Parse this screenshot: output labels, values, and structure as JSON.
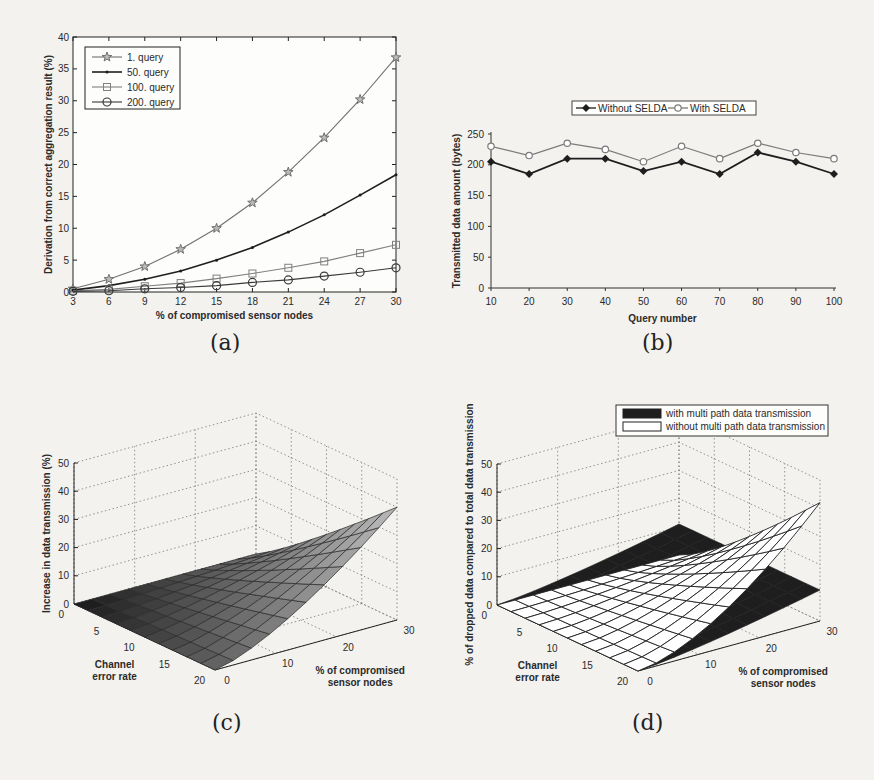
{
  "figure": {
    "captions": [
      "(a)",
      "(b)",
      "(c)",
      "(d)"
    ]
  },
  "chart_data": [
    {
      "id": "a",
      "type": "line",
      "title": "",
      "xlabel": "% of compromised sensor nodes",
      "ylabel": "Derivation from correct aggregation result (%)",
      "x": [
        3,
        6,
        9,
        12,
        15,
        18,
        21,
        24,
        27,
        30
      ],
      "xlim": [
        3,
        30
      ],
      "ylim": [
        0,
        40
      ],
      "yticks": [
        0,
        5,
        10,
        15,
        20,
        25,
        30,
        35,
        40
      ],
      "grid": false,
      "legend_position": "upper-left",
      "series": [
        {
          "name": "1. query",
          "marker": "star",
          "color": "#707070",
          "values": [
            0.5,
            2.0,
            4.0,
            6.7,
            10.0,
            14.0,
            18.8,
            24.2,
            30.2,
            36.8
          ]
        },
        {
          "name": "50. query",
          "marker": "dot",
          "color": "#1e1e1e",
          "values": [
            0.3,
            1.0,
            2.0,
            3.3,
            5.0,
            7.0,
            9.4,
            12.1,
            15.2,
            18.4
          ]
        },
        {
          "name": "100. query",
          "marker": "square",
          "color": "#808080",
          "values": [
            0.2,
            0.4,
            0.9,
            1.4,
            2.1,
            2.9,
            3.8,
            4.8,
            6.1,
            7.4
          ]
        },
        {
          "name": "200. query",
          "marker": "circle",
          "color": "#3a3a3a",
          "values": [
            0.1,
            0.2,
            0.5,
            0.7,
            1.0,
            1.5,
            1.9,
            2.5,
            3.1,
            3.8
          ]
        }
      ]
    },
    {
      "id": "b",
      "type": "line",
      "title": "",
      "xlabel": "Query number",
      "ylabel": "Transmitted data amount (bytes)",
      "x": [
        10,
        20,
        30,
        40,
        50,
        60,
        70,
        80,
        90,
        100
      ],
      "xlim": [
        10,
        100
      ],
      "ylim": [
        0,
        250
      ],
      "yticks": [
        0,
        50,
        100,
        150,
        200,
        250
      ],
      "grid": false,
      "legend_position": "top-center-outside",
      "series": [
        {
          "name": "Without SELDA",
          "marker": "filled-diamond",
          "color": "#1e1e1e",
          "values": [
            205,
            185,
            210,
            210,
            190,
            205,
            185,
            220,
            205,
            185
          ]
        },
        {
          "name": "With SELDA",
          "marker": "open-circle",
          "color": "#7a7a7a",
          "values": [
            230,
            215,
            235,
            225,
            205,
            230,
            210,
            235,
            220,
            210
          ]
        }
      ]
    },
    {
      "id": "c",
      "type": "surface3d",
      "title": "",
      "zlabel": "Increase in data transmission (%)",
      "xlabel": "Channel error rate",
      "ylabel": "% of compromised sensor nodes",
      "xticks": [
        0,
        5,
        10,
        15,
        20
      ],
      "yticks": [
        0,
        10,
        20,
        30
      ],
      "zticks": [
        0,
        10,
        20,
        30,
        40,
        50
      ],
      "zlim": [
        0,
        50
      ],
      "grid": true,
      "surface": {
        "description": "shaded surface rising from 0 to ~40% at max compromised nodes (30) and max channel error (20)",
        "corner_values": {
          "err0_nodes0": 0,
          "err20_nodes0": 0,
          "err0_nodes30": 0,
          "err20_nodes30": 40
        }
      }
    },
    {
      "id": "d",
      "type": "surface3d",
      "title": "",
      "zlabel": "% of dropped data compared to total data transmission",
      "xlabel": "Channel error rate",
      "ylabel": "% of compromised sensor nodes",
      "xticks": [
        0,
        5,
        10,
        15,
        20
      ],
      "yticks": [
        0,
        10,
        20,
        30
      ],
      "zticks": [
        0,
        10,
        20,
        30,
        40,
        50
      ],
      "zlim": [
        0,
        50
      ],
      "grid": true,
      "legend_position": "top-right",
      "series": [
        {
          "name": "with multi path data transmission",
          "fill": "#1e1e1e",
          "corner_values": {
            "err0_nodes0": 0,
            "err20_nodes0": 0,
            "err0_nodes30": 11,
            "err20_nodes30": 11
          }
        },
        {
          "name": "without multi path data transmission",
          "fill": "#ffffff",
          "corner_values": {
            "err0_nodes0": 0,
            "err20_nodes0": 0,
            "err0_nodes30": 0,
            "err20_nodes30": 42
          }
        }
      ]
    }
  ]
}
